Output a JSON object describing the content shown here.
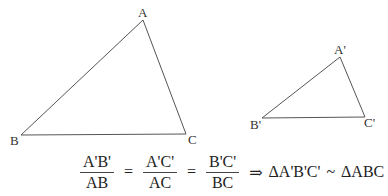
{
  "figure": {
    "triangle_large": {
      "vertices": {
        "A": [
          143,
          20
        ],
        "B": [
          21,
          135
        ],
        "C": [
          186,
          134
        ]
      },
      "labels": {
        "A": "A",
        "B": "B",
        "C": "C"
      }
    },
    "triangle_small": {
      "vertices": {
        "A": [
          340,
          57
        ],
        "B": [
          262,
          118
        ],
        "C": [
          365,
          117
        ]
      },
      "labels": {
        "A": "A'",
        "B": "B'",
        "C": "C'"
      }
    },
    "line_color": "#555555"
  },
  "equation": {
    "frac1": {
      "num": "A'B'",
      "den": "AB"
    },
    "frac2": {
      "num": "A'C'",
      "den": "AC"
    },
    "frac3": {
      "num": "B'C'",
      "den": "BC"
    },
    "eq1": "=",
    "eq2": "=",
    "implies": "⇒",
    "lhs": "ΔA'B'C'",
    "similar": "~",
    "rhs": "ΔABC"
  }
}
